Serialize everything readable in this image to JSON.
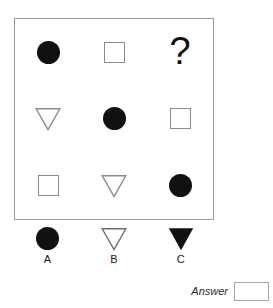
{
  "puzzle": {
    "type": "matrix-reasoning",
    "matrix": {
      "rows": [
        [
          {
            "shape": "circle",
            "fill": "filled",
            "label": "filled-circle"
          },
          {
            "shape": "square",
            "fill": "outline",
            "label": "outline-square"
          },
          {
            "shape": "question",
            "fill": "none",
            "label": "missing-cell",
            "text": "?"
          }
        ],
        [
          {
            "shape": "triangle-down",
            "fill": "outline",
            "label": "outline-triangle"
          },
          {
            "shape": "circle",
            "fill": "filled",
            "label": "filled-circle"
          },
          {
            "shape": "square",
            "fill": "outline",
            "label": "outline-square"
          }
        ],
        [
          {
            "shape": "square",
            "fill": "outline",
            "label": "outline-square"
          },
          {
            "shape": "triangle-down",
            "fill": "outline",
            "label": "outline-triangle"
          },
          {
            "shape": "circle",
            "fill": "filled",
            "label": "filled-circle"
          }
        ]
      ]
    },
    "options": [
      {
        "key": "A",
        "shape": "circle",
        "fill": "filled",
        "label": "filled-circle"
      },
      {
        "key": "B",
        "shape": "triangle-down",
        "fill": "outline",
        "label": "outline-triangle"
      },
      {
        "key": "C",
        "shape": "triangle-down",
        "fill": "filled",
        "label": "filled-triangle"
      }
    ],
    "answer": {
      "label": "Answer",
      "value": "",
      "placeholder": ""
    }
  },
  "colors": {
    "ink": "#111111",
    "outline": "#8b8b8b",
    "frame": "#9a9a9a",
    "field_border": "#a8a8a8",
    "background": "#ffffff"
  }
}
